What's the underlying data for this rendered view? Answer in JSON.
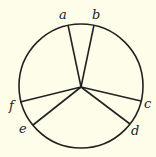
{
  "diagram": {
    "type": "circle-partition",
    "background": "#fdfde9",
    "stroke": "#222222",
    "circle": {
      "cx": 81,
      "cy": 86,
      "r": 62
    },
    "hub": {
      "x": 81,
      "y": 87
    },
    "points": [
      {
        "id": "a",
        "label": "a",
        "x": 68,
        "y": 25,
        "lx": 59,
        "ly": 19
      },
      {
        "id": "b",
        "label": "b",
        "x": 94,
        "y": 25,
        "lx": 92,
        "ly": 19
      },
      {
        "id": "c",
        "label": "c",
        "x": 141,
        "y": 101,
        "lx": 144,
        "ly": 108
      },
      {
        "id": "d",
        "label": "d",
        "x": 130,
        "y": 124,
        "lx": 131,
        "ly": 135
      },
      {
        "id": "e",
        "label": "e",
        "x": 33,
        "y": 125,
        "lx": 19,
        "ly": 133
      },
      {
        "id": "f",
        "label": "f",
        "x": 20,
        "y": 102,
        "lx": 9,
        "ly": 110
      }
    ]
  }
}
